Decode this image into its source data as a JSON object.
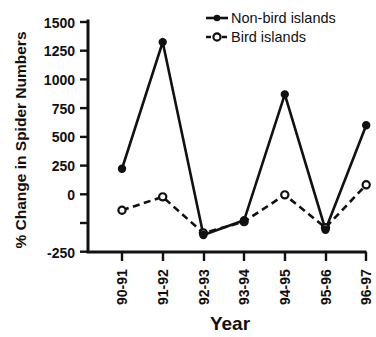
{
  "chart_data": {
    "type": "line",
    "title": "",
    "xlabel": "Year",
    "ylabel": "% Change in Spider Numbers",
    "categories": [
      "90-91",
      "91-92",
      "92-93",
      "93-94",
      "94-95",
      "95-96",
      "96-97"
    ],
    "ylim": [
      -250,
      1500
    ],
    "yticks": [
      -250,
      0,
      250,
      500,
      750,
      1000,
      1250,
      1500
    ],
    "ytick_labels": [
      "-250",
      "0",
      "250",
      "500",
      "750",
      "1000",
      "1250",
      "1500"
    ],
    "grid": false,
    "legend_position": "top-right",
    "series": [
      {
        "name": "Non-bird islands",
        "marker": "filled-circle",
        "line_style": "solid",
        "color": "#111111",
        "values": [
          405,
          1350,
          -90,
          20,
          960,
          -50,
          730
        ]
      },
      {
        "name": "Bird islands",
        "marker": "open-circle",
        "line_style": "dashed",
        "color": "#111111",
        "values": [
          95,
          195,
          -75,
          10,
          210,
          -35,
          285
        ]
      }
    ]
  },
  "legend": {
    "items": [
      {
        "label": "Non-bird islands"
      },
      {
        "label": "Bird islands"
      }
    ]
  },
  "axes": {
    "y_title": "% Change in Spider Numbers",
    "x_title": "Year"
  }
}
